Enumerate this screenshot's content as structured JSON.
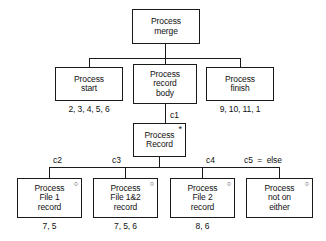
{
  "diagram": {
    "colors": {
      "line": "#1a1a1a",
      "text": "#111111",
      "background": "#ffffff"
    },
    "nodes": {
      "root": {
        "line1": "Process",
        "line2": "merge",
        "marker": ""
      },
      "start": {
        "line1": "Process",
        "line2": "start",
        "marker": ""
      },
      "record_body": {
        "line1": "Process",
        "line2": "record",
        "line3": "body",
        "marker": ""
      },
      "finish": {
        "line1": "Process",
        "line2": "finish",
        "marker": ""
      },
      "record": {
        "line1": "Process",
        "line2": "Record",
        "marker": "*"
      },
      "file1": {
        "line1": "Process",
        "line2": "File 1",
        "line3": "record",
        "marker": "○"
      },
      "file12": {
        "line1": "Process",
        "line2": "File 1&2",
        "line3": "record",
        "marker": "○"
      },
      "file2": {
        "line1": "Process",
        "line2": "File 2",
        "line3": "record",
        "marker": "○"
      },
      "neither": {
        "line1": "Process",
        "line2": "not on",
        "line3": "either",
        "marker": "○"
      }
    },
    "captions": {
      "start": "2, 3, 4, 5, 6",
      "finish": "9, 10, 11, 1",
      "file1": "7, 5",
      "file12": "7, 5, 6",
      "file2": "8, 6"
    },
    "conditions": {
      "c1": "c1",
      "c2": "c2",
      "c3": "c3",
      "c4": "c4",
      "c5": "c5  =  else"
    }
  }
}
